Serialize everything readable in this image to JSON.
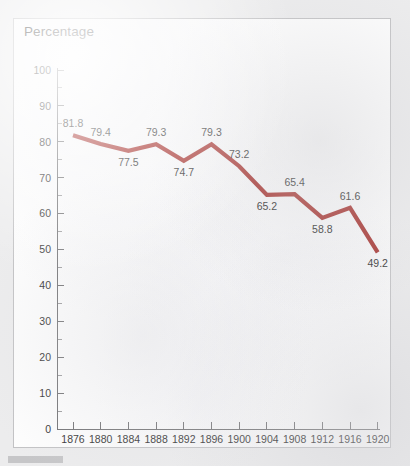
{
  "page": {
    "background_color": "#ececed",
    "panel_background_color": "#fdfdfd",
    "panel_border_color": "#c2c2c4"
  },
  "footer": {
    "bar_label": "gray-bar",
    "color": "#c6c6c8"
  },
  "chart_data": {
    "type": "line",
    "title": "Percentage",
    "xlabel": "",
    "ylabel": "",
    "ylim": [
      0,
      100
    ],
    "ytick_step": 10,
    "yminor_step": 5,
    "grid": false,
    "legend": "none",
    "line_color": "#a32a26",
    "categories": [
      "1876",
      "1880",
      "1884",
      "1888",
      "1892",
      "1896",
      "1900",
      "1904",
      "1908",
      "1912",
      "1916",
      "1920"
    ],
    "values": [
      81.8,
      79.4,
      77.5,
      79.3,
      74.7,
      79.3,
      73.2,
      65.2,
      65.4,
      58.8,
      61.6,
      49.2
    ],
    "point_labels": [
      "81.8",
      "79.4",
      "77.5",
      "79.3",
      "74.7",
      "79.3",
      "73.2",
      "65.2",
      "65.4",
      "58.8",
      "61.6",
      "49.2"
    ],
    "point_label_positions": [
      "above",
      "above",
      "below",
      "above",
      "below",
      "above",
      "above",
      "below",
      "above",
      "below",
      "above",
      "below"
    ],
    "ytick_labels": [
      "100",
      "90",
      "80",
      "70",
      "60",
      "50",
      "40",
      "30",
      "20",
      "10",
      "0"
    ],
    "ytick_values": [
      100,
      90,
      80,
      70,
      60,
      50,
      40,
      30,
      20,
      10,
      0
    ]
  }
}
